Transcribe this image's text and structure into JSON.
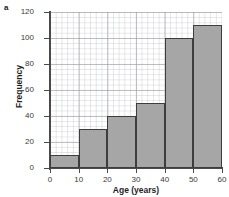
{
  "panel": {
    "label": "a"
  },
  "chart_data": {
    "type": "bar",
    "title": "",
    "xlabel": "Age (years)",
    "ylabel": "Frequency",
    "categories": [
      "0-10",
      "10-20",
      "20-30",
      "30-40",
      "40-50",
      "50-60"
    ],
    "bin_edges": [
      0,
      10,
      20,
      30,
      40,
      50,
      60
    ],
    "values": [
      10,
      30,
      40,
      50,
      100,
      110
    ],
    "xlim": [
      0,
      60
    ],
    "ylim": [
      0,
      120
    ],
    "xticks": [
      0,
      10,
      20,
      30,
      40,
      50,
      60
    ],
    "yticks": [
      0,
      20,
      40,
      60,
      80,
      100,
      120
    ],
    "xtick_labels": [
      "0",
      "10",
      "20",
      "30",
      "40",
      "50",
      "60"
    ],
    "ytick_labels": [
      "0",
      "20",
      "40",
      "60",
      "80",
      "100",
      "120"
    ],
    "grid": true,
    "grid_style": "graph-paper",
    "legend": false,
    "bar_color": "#a6a6a6",
    "bar_edge_color": "#3d3d3d",
    "axis_color": "#4a4a4a",
    "background_color": "#ffffff"
  }
}
